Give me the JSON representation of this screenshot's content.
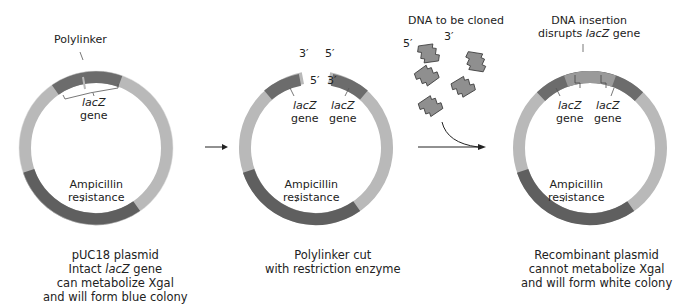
{
  "colors": {
    "ring_light": "#b9b9b9",
    "lacz": "#6c6c6c",
    "amp": "#5f5f5f",
    "insert": "#9a9a9a",
    "edge": "#2a2a2a"
  },
  "panels": [
    {
      "polylinker_label": "Polylinker",
      "lacz_label_1": "lacZ",
      "lacz_label_2": "gene",
      "amp_label_1": "Ampicillin",
      "amp_label_2": "resistance",
      "caption_1": "pUC18 plasmid",
      "caption_2a": "Intact ",
      "caption_2b": "lacZ",
      "caption_2c": " gene",
      "caption_3": "can metabolize Xgal",
      "caption_4": "and will form blue colony"
    },
    {
      "end_left_top": "3′",
      "end_left_bottom": "5′",
      "end_right_top": "5′",
      "end_right_bottom": "3′",
      "lacz_left_1": "lacZ",
      "lacz_left_2": "gene",
      "lacz_right_1": "lacZ",
      "lacz_right_2": "gene",
      "amp_label_1": "Ampicillin",
      "amp_label_2": "resistance",
      "caption_1": "Polylinker cut",
      "caption_2": "with restriction enzyme"
    },
    {
      "insert_label_1": "DNA insertion",
      "insert_label_2a": "disrupts ",
      "insert_label_2b": "lacZ",
      "insert_label_2c": " gene",
      "lacz_left_1": "lacZ",
      "lacz_left_2": "gene",
      "lacz_right_1": "lacZ",
      "lacz_right_2": "gene",
      "amp_label_1": "Ampicillin",
      "amp_label_2": "resistance",
      "caption_1": "Recombinant plasmid",
      "caption_2": "cannot metabolize Xgal",
      "caption_3": "and will form white colony"
    }
  ],
  "dna_fragments": {
    "title": "DNA to be cloned",
    "end_5": "5′",
    "end_3": "3′"
  }
}
